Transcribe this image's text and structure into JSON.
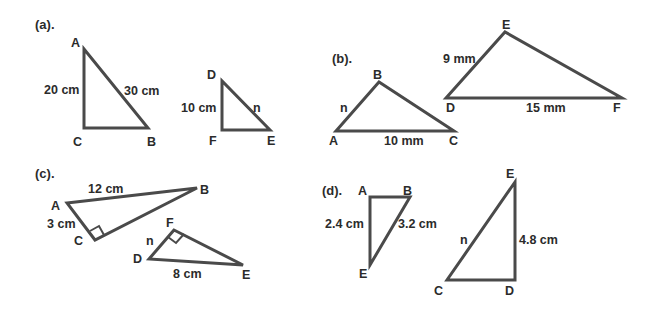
{
  "parts": {
    "a": {
      "label": "(a).",
      "t1": {
        "vertices": {
          "A": "A",
          "B": "B",
          "C": "C"
        },
        "sides": {
          "AC": "20 cm",
          "AB": "30 cm"
        }
      },
      "t2": {
        "vertices": {
          "D": "D",
          "E": "E",
          "F": "F"
        },
        "sides": {
          "DF": "10 cm",
          "DE": "n"
        }
      }
    },
    "b": {
      "label": "(b).",
      "t1": {
        "vertices": {
          "A": "A",
          "B": "B",
          "C": "C"
        },
        "sides": {
          "AB": "n",
          "AC": "10 mm"
        }
      },
      "t2": {
        "vertices": {
          "D": "D",
          "E": "E",
          "F": "F"
        },
        "sides": {
          "DE": "9 mm",
          "DF": "15 mm"
        }
      }
    },
    "c": {
      "label": "(c).",
      "t1": {
        "vertices": {
          "A": "A",
          "B": "B",
          "C": "C"
        },
        "sides": {
          "AB": "12 cm",
          "AC": "3 cm"
        },
        "right_angle_at": "C"
      },
      "t2": {
        "vertices": {
          "D": "D",
          "E": "E",
          "F": "F"
        },
        "sides": {
          "DF": "n",
          "DE": "8 cm"
        },
        "right_angle_at": "F"
      }
    },
    "d": {
      "label": "(d).",
      "t1": {
        "vertices": {
          "A": "A",
          "B": "B",
          "E": "E"
        },
        "sides": {
          "AE": "2.4 cm",
          "BE": "3.2 cm"
        }
      },
      "t2": {
        "vertices": {
          "C": "C",
          "D": "D",
          "E": "E"
        },
        "sides": {
          "CE": "n",
          "DE": "4.8 cm"
        }
      }
    }
  },
  "colors": {
    "stroke": "#4a4a4a",
    "text": "#2b2b2b",
    "background": "#ffffff"
  }
}
